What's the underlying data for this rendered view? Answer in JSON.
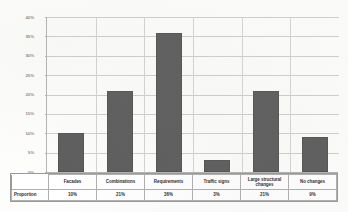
{
  "chart_data": {
    "type": "bar",
    "title": "",
    "subtitle": "",
    "xlabel": "",
    "ylabel": "",
    "categories": [
      "Facades",
      "Combinations",
      "Requirements",
      "Traffic signs",
      "Large structural changes",
      "No changes"
    ],
    "values": [
      10,
      21,
      36,
      3,
      21,
      9
    ],
    "value_labels": [
      "10%",
      "21%",
      "36%",
      "3%",
      "21%",
      "9%"
    ],
    "series": [
      {
        "name": "Proportion",
        "values": [
          10,
          21,
          36,
          3,
          21,
          9
        ]
      }
    ],
    "ylim": [
      0,
      40
    ],
    "ytick_values": [
      40,
      35,
      30,
      25,
      20,
      15,
      10,
      5,
      0
    ],
    "ytick_labels": [
      "40%",
      "35%",
      "30%",
      "25%",
      "20%",
      "15%",
      "10%",
      "5%",
      "0%"
    ],
    "grid": true,
    "legend": false,
    "legend_position": "none",
    "bar_color": "#5e5e5e",
    "gridline_color": "#cfcfcf",
    "axis_color": "#b4b4b4"
  },
  "data_table": {
    "row_header": "Proportion",
    "columns": [
      "Facades",
      "Combinations",
      "Requirements",
      "Traffic signs",
      "Large structural changes",
      "No changes"
    ],
    "values": [
      "10%",
      "21%",
      "36%",
      "3%",
      "21%",
      "9%"
    ]
  }
}
